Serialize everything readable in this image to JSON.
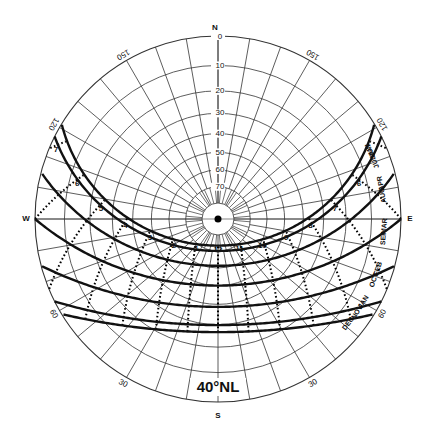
{
  "title": "40°NL",
  "latitude": 40,
  "geometry": {
    "cx": 218,
    "cy": 219,
    "R": 183
  },
  "compass": {
    "north": "N",
    "south": "S",
    "east": "E",
    "west": "W"
  },
  "altitude_labels": [
    "0",
    "10",
    "20",
    "30",
    "40",
    "50",
    "60",
    "70"
  ],
  "altitude_rings": [
    0,
    10,
    20,
    30,
    40,
    50,
    60,
    70,
    80
  ],
  "azimuth_labels": [
    {
      "text": "150",
      "az": -30
    },
    {
      "text": "150",
      "az": 30
    },
    {
      "text": "60",
      "az": 120
    },
    {
      "text": "60",
      "az": -120
    },
    {
      "text": "30",
      "az": 150
    },
    {
      "text": "30",
      "az": -150
    },
    {
      "text": "120",
      "az": 60
    },
    {
      "text": "120",
      "az": -60
    }
  ],
  "sun_paths": [
    {
      "decl": 23.45,
      "label_e": "JUN",
      "label_w": ""
    },
    {
      "decl": 20.0,
      "label_e": "MAY",
      "label_w": ""
    },
    {
      "decl": 20.5,
      "label_e": "JUL",
      "label_w": ""
    },
    {
      "decl": 11.5,
      "label_e": "APR",
      "label_w": ""
    },
    {
      "decl": 11.0,
      "label_e": "AUG",
      "label_w": ""
    },
    {
      "decl": 0.0,
      "label_e": "MAR",
      "label_w": ""
    },
    {
      "decl": -0.5,
      "label_e": "SEP",
      "label_w": ""
    },
    {
      "decl": -11.5,
      "label_e": "FEB",
      "label_w": ""
    },
    {
      "decl": -11.0,
      "label_e": "OCT",
      "label_w": ""
    },
    {
      "decl": -20.0,
      "label_e": "JAN",
      "label_w": ""
    },
    {
      "decl": -20.5,
      "label_e": "NOV",
      "label_w": ""
    },
    {
      "decl": -23.45,
      "label_e": "DEC",
      "label_w": ""
    }
  ],
  "drawn_paths": [
    23.45,
    20.2,
    11.3,
    0,
    -11.3,
    -20.2,
    -23.45
  ],
  "month_labels": [
    {
      "text": "JUN",
      "decl": 23.45,
      "side": "inner"
    },
    {
      "text": "MAY",
      "decl": 20.2,
      "side": "outer"
    },
    {
      "text": "JUL",
      "decl": 20.2,
      "side": "inner"
    },
    {
      "text": "APR",
      "decl": 11.3,
      "side": "outer"
    },
    {
      "text": "AUG",
      "decl": 11.3,
      "side": "inner"
    },
    {
      "text": "MAR",
      "decl": 0,
      "side": "outer"
    },
    {
      "text": "SEP",
      "decl": 0,
      "side": "inner"
    },
    {
      "text": "FEB",
      "decl": -11.3,
      "side": "outer"
    },
    {
      "text": "OCT",
      "decl": -11.3,
      "side": "inner"
    },
    {
      "text": "JAN",
      "decl": -20.2,
      "side": "outer"
    },
    {
      "text": "NOV",
      "decl": -20.2,
      "side": "inner"
    },
    {
      "text": "DEC",
      "decl": -23.45,
      "side": "inner"
    }
  ],
  "hour_labels": {
    "afternoon": [
      "1",
      "2",
      "3",
      "4",
      "5",
      "6",
      "7"
    ],
    "noon": "12",
    "morning": [
      "11",
      "10",
      "9",
      "8",
      "7",
      "6"
    ]
  },
  "colors": {
    "grid": "#333333",
    "path": "#111111",
    "background": "#ffffff"
  }
}
